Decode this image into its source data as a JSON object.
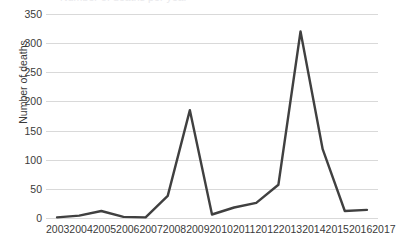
{
  "chart_data": {
    "type": "line",
    "title": "",
    "title_remnant": "Number of deaths per year",
    "xlabel": "",
    "ylabel": "Number of deaths",
    "categories": [
      "2003",
      "2004",
      "2005",
      "2006",
      "2007",
      "2008",
      "2009",
      "2010",
      "2011",
      "2012",
      "2013",
      "2014",
      "2015",
      "2016",
      "2017"
    ],
    "x_tick_labels": [
      "2003",
      "2004",
      "2005",
      "2006",
      "2007",
      "2008",
      "2009",
      "2010",
      "2011",
      "2012",
      "2013",
      "2014",
      "2015",
      "2016",
      "2017"
    ],
    "y_tick_labels": [
      "350",
      "300",
      "250",
      "200",
      "150",
      "100",
      "50",
      "0"
    ],
    "y_ticks": [
      350,
      300,
      250,
      200,
      150,
      100,
      50,
      0
    ],
    "ylim": [
      0,
      350
    ],
    "grid": true,
    "legend": false,
    "legend_position": "none",
    "series": [
      {
        "name": "Number of deaths",
        "color": "#404040",
        "values": [
          1,
          4,
          12,
          2,
          1,
          38,
          185,
          6,
          18,
          26,
          57,
          320,
          118,
          12,
          14
        ]
      }
    ]
  },
  "colors": {
    "line": "#404040",
    "gridline": "#d9d9d9",
    "text": "#3a3a3a",
    "background": "#ffffff"
  }
}
